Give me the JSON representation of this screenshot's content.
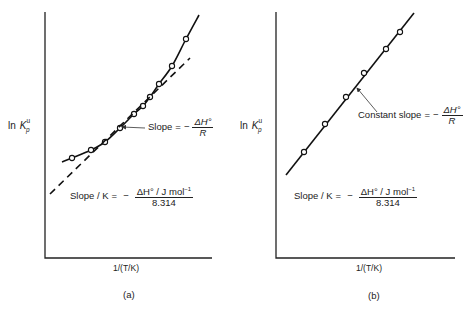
{
  "figure": {
    "panel_a": {
      "tag": "(a)",
      "ylabel": {
        "prefix": "ln",
        "symbol": "K",
        "sup": "u",
        "sub": "p"
      },
      "xlabel": "1/(T/K)",
      "annotation": {
        "text": "Slope",
        "eq": "=",
        "minus": "−",
        "num": "ΔH°",
        "den": "R"
      },
      "formula": {
        "lhs": "Slope / K",
        "eq": "=",
        "minus": "−",
        "num": "ΔH° / J mol",
        "num_sup": "−1",
        "den": "8.314"
      }
    },
    "panel_b": {
      "tag": "(b)",
      "ylabel": {
        "prefix": "ln",
        "symbol": "K",
        "sup": "u",
        "sub": "p"
      },
      "xlabel": "1/(T/K)",
      "annotation": {
        "text": "Constant slope",
        "eq": "=",
        "minus": "−",
        "num": "ΔH°",
        "den": "R"
      },
      "formula": {
        "lhs": "Slope / K",
        "eq": "=",
        "minus": "−",
        "num": "ΔH° / J mol",
        "num_sup": "−1",
        "den": "8.314"
      }
    }
  },
  "chart_data": [
    {
      "type": "scatter",
      "title": "(a)",
      "xlabel": "1/(T/K)",
      "ylabel": "ln K_p^u",
      "grid": false,
      "legend": "none",
      "axes_px": {
        "x0": 45,
        "y0": 258,
        "x1": 212,
        "ytop": 12
      },
      "series": [
        {
          "name": "data points (curved fit)",
          "style": "solid-curve-with-open-circles",
          "points_px": [
            [
              72,
              158
            ],
            [
              91,
              150
            ],
            [
              105,
              142
            ],
            [
              120,
              128
            ],
            [
              134,
              114
            ],
            [
              143,
              106
            ],
            [
              150,
              97
            ],
            [
              159,
              84
            ],
            [
              172,
              66
            ],
            [
              186,
              39
            ]
          ],
          "curve_px": [
            [
              62,
              162
            ],
            [
              72,
              158
            ],
            [
              91,
              150
            ],
            [
              105,
              142
            ],
            [
              120,
              128
            ],
            [
              134,
              114
            ],
            [
              143,
              106
            ],
            [
              150,
              97
            ],
            [
              159,
              84
            ],
            [
              172,
              66
            ],
            [
              186,
              39
            ],
            [
              199,
              15
            ]
          ]
        },
        {
          "name": "tangent",
          "style": "dashed",
          "line_px": [
            [
              50,
              194
            ],
            [
              190,
              58
            ]
          ]
        }
      ],
      "annotations": [
        "Slope = −ΔH°/R",
        "Slope/K = −(ΔH°/J mol⁻¹)/8.314"
      ],
      "arrow_px": {
        "from": [
          145,
          128
        ],
        "to": [
          122,
          127
        ]
      }
    },
    {
      "type": "scatter",
      "title": "(b)",
      "xlabel": "1/(T/K)",
      "ylabel": "ln K_p^u",
      "grid": false,
      "legend": "none",
      "axes_px": {
        "x0": 276,
        "y0": 258,
        "x1": 455,
        "ytop": 12
      },
      "series": [
        {
          "name": "data points (linear)",
          "style": "solid-line-with-open-circles",
          "points_px": [
            [
              304,
              152
            ],
            [
              325,
              124
            ],
            [
              346,
              97
            ],
            [
              364,
              73
            ],
            [
              386,
              49
            ],
            [
              400,
              32
            ]
          ],
          "line_px": [
            [
              286,
              175
            ],
            [
              414,
              13
            ]
          ]
        }
      ],
      "annotations": [
        "Constant slope = −ΔH°/R",
        "Slope/K = −(ΔH°/J mol⁻¹)/8.314"
      ],
      "arrow_px": {
        "from": [
          377,
          112
        ],
        "to": [
          357,
          88
        ]
      }
    }
  ]
}
